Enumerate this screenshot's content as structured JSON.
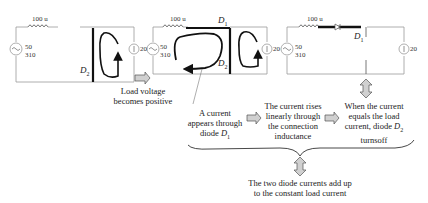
{
  "circuits": [
    {
      "inductor_label": "100 u",
      "source_freq": "50",
      "source_voltage": "310",
      "load_current": "20",
      "diode_label": "D",
      "diode_sub": "2"
    },
    {
      "inductor_label": "100 u",
      "source_freq": "50",
      "source_voltage": "310",
      "load_current": "20",
      "diode1_label": "D",
      "diode1_sub": "1",
      "diode2_label": "D",
      "diode2_sub": "2"
    },
    {
      "inductor_label": "100 u",
      "source_freq": "50",
      "source_voltage": "310",
      "load_current": "20",
      "diode_label": "D",
      "diode_sub": "1"
    }
  ],
  "captions": {
    "load_voltage": [
      "Load voltage",
      "becomes positive"
    ],
    "current_appears": [
      "A current",
      "appears through",
      "diode "
    ],
    "current_appears_diode": "D",
    "current_appears_sub": "1",
    "current_rises": [
      "The current rises",
      "linearly through",
      "the connection",
      "inductance"
    ],
    "current_equals": [
      "When the current",
      "equals the load",
      "current, diode "
    ],
    "current_equals_diode": "D",
    "current_equals_sub": "2",
    "current_equals_last": "turnsoff",
    "summary": [
      "The two diode currents add up",
      "to the constant load current"
    ]
  },
  "colors": {
    "wire": "#9a9a9a",
    "bold": "#111111",
    "arrow_fill": "#d0d0d0",
    "text": "#222222"
  }
}
